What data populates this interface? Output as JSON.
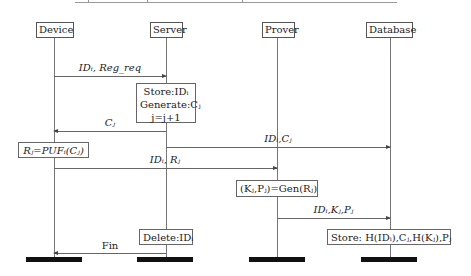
{
  "actors": [
    {
      "name": "Device"
    },
    {
      "name": "Server"
    },
    {
      "name": "Prover"
    },
    {
      "name": "Database"
    }
  ],
  "messages": [
    {
      "from": "Device",
      "to": "Server",
      "label": "IDᵢ, Reg_req"
    },
    {
      "from": "Server",
      "to": "Device",
      "label": "Cⱼ"
    },
    {
      "from": "Server",
      "to": "Database",
      "label": "IDᵢ,Cⱼ"
    },
    {
      "from": "Device",
      "to": "Prover",
      "label": "IDᵢ, Rⱼ"
    },
    {
      "from": "Prover",
      "to": "Database",
      "label": "IDᵢ,Kⱼ,Pⱼ"
    },
    {
      "from": "Server",
      "to": "Device",
      "label": "Fin"
    }
  ],
  "notes": {
    "server_store": [
      "Store:IDᵢ",
      "Generate:Cⱼ",
      "j=j+1"
    ],
    "device_puf": "Rⱼ=PUFᵢ(Cⱼ)",
    "prover_gen": "(Kⱼ,Pⱼ)=Gen(Rⱼ)",
    "server_delete": "Delete:IDᵢ",
    "database_store": "Store: H(IDᵢ),Cⱼ,H(Kⱼ),Pⱼ"
  }
}
